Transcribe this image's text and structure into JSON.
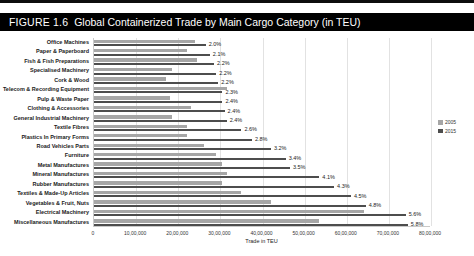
{
  "header": {
    "figure_number": "FIGURE 1.6",
    "title": "Global Containerized Trade by Main Cargo Category (in TEU)"
  },
  "colors": {
    "banner_bg": "#000000",
    "banner_text": "#ffffff",
    "series_2005": "#a6a6a6",
    "series_2015": "#4d4d4d",
    "gridline": "#e2e2e2"
  },
  "chart_data": {
    "type": "bar",
    "orientation": "horizontal",
    "title": "FIGURE 1.6 Global Containerized Trade by Main Cargo Category (in TEU)",
    "xlabel": "Trade in TEU",
    "ylabel": "",
    "xlim": [
      0,
      8000000
    ],
    "grid": true,
    "legend_position": "right",
    "x_ticks": [
      "0",
      "10,00,000",
      "20,00,000",
      "30,00,000",
      "40,00,000",
      "50,00,000",
      "60,00,000",
      "70,00,000",
      "80,00,000"
    ],
    "categories": [
      "Office Machines",
      "Paper & Paperboard",
      "Fish & Fish Preparations",
      "Specialised Machinery",
      "Cork & Wood",
      "Telecom & Recording Equipment",
      "Pulp & Waste Paper",
      "Clothing & Accessories",
      "General Industrial Machinery",
      "Textile Fibres",
      "Plastics In Primary Forms",
      "Road Vehicles Parts",
      "Furniture",
      "Metal Manufactures",
      "Mineral Manufactures",
      "Rubber Manufactures",
      "Textiles & Made-Up Articles",
      "Vegetables & Fruit, Nuts",
      "Electrical Machinery",
      "Miscellaneous Manufactures"
    ],
    "series": [
      {
        "name": "2005",
        "color": "#a6a6a6",
        "values": [
          2400000,
          2200000,
          2450000,
          1850000,
          1700000,
          3150000,
          1800000,
          2300000,
          1850000,
          2200000,
          2200000,
          2600000,
          2900000,
          3050000,
          3150000,
          3050000,
          3500000,
          4200000,
          6400000,
          5350000
        ]
      },
      {
        "name": "2015",
        "color": "#4d4d4d",
        "values": [
          2650000,
          2750000,
          2850000,
          2900000,
          2950000,
          3050000,
          3050000,
          3100000,
          3150000,
          3500000,
          3750000,
          4200000,
          4550000,
          4650000,
          5350000,
          5700000,
          6100000,
          6450000,
          7400000,
          7450000
        ],
        "data_labels": [
          "2.0%",
          "2.1%",
          "2.2%",
          "2.2%",
          "2.2%",
          "2.3%",
          "2.4%",
          "2.4%",
          "2.4%",
          "2.6%",
          "2.8%",
          "3.2%",
          "3.4%",
          "3.5%",
          "4.1%",
          "4.3%",
          "4.5%",
          "4.8%",
          "5.6%",
          "5.8%"
        ]
      }
    ],
    "legend": [
      {
        "label": "2005",
        "color": "#a6a6a6"
      },
      {
        "label": "2015",
        "color": "#4d4d4d"
      }
    ]
  }
}
